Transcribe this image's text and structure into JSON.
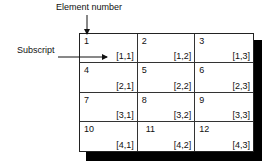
{
  "labels": {
    "element_number": "Element number",
    "subscript": "Subscript"
  },
  "grid": {
    "rows": 4,
    "cols": 3,
    "cells": [
      {
        "number": "1",
        "subscript": "[1,1]"
      },
      {
        "number": "2",
        "subscript": "[1,2]"
      },
      {
        "number": "3",
        "subscript": "[1,3]"
      },
      {
        "number": "4",
        "subscript": "[2,1]"
      },
      {
        "number": "5",
        "subscript": "[2,2]"
      },
      {
        "number": "6",
        "subscript": "[2,3]"
      },
      {
        "number": "7",
        "subscript": "[3,1]"
      },
      {
        "number": "8",
        "subscript": "[3,2]"
      },
      {
        "number": "9",
        "subscript": "[3,3]"
      },
      {
        "number": "10",
        "subscript": "[4,1]"
      },
      {
        "number": "11",
        "subscript": "[4,2]"
      },
      {
        "number": "12",
        "subscript": "[4,3]"
      }
    ]
  }
}
